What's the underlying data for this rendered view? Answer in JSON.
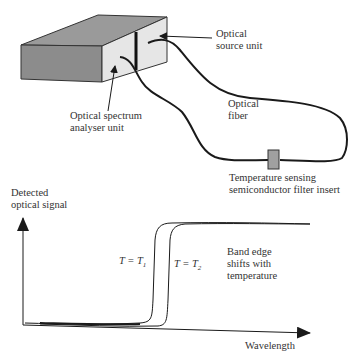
{
  "apparatus": {
    "source_label_line1": "Optical",
    "source_label_line2": "source unit",
    "analyser_label_line1": "Optical spectrum",
    "analyser_label_line2": "analyser unit",
    "fiber_label_line1": "Optical",
    "fiber_label_line2": "fiber",
    "filter_label_line1": "Temperature sensing",
    "filter_label_line2": "semiconductor filter insert"
  },
  "graph": {
    "ylabel_line1": "Detected",
    "ylabel_line2": "optical signal",
    "xlabel": "Wavelength",
    "curve1_label": "T = T",
    "curve1_sub": "1",
    "curve2_label": "T = T",
    "curve2_sub": "2",
    "annotation_line1": "Band edge",
    "annotation_line2": "shifts with",
    "annotation_line3": "temperature"
  },
  "colors": {
    "box_front": "#8c8c8c",
    "box_top": "#9a9a9a",
    "box_side": "#e6e6e6",
    "filter": "#a0a0a0",
    "line": "#1a1a1a"
  }
}
